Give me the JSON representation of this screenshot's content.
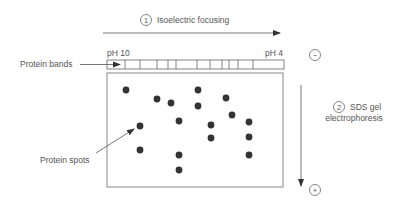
{
  "step1": {
    "number": "1",
    "label": "Isoelectric focusing"
  },
  "step2": {
    "number": "2",
    "label_line1": "SDS gel",
    "label_line2": "electrophoresis"
  },
  "ph_left": "pH 10",
  "ph_right": "pH 4",
  "labels": {
    "bands": "Protein bands",
    "spots": "Protein spots"
  },
  "electrodes": {
    "negative": "−",
    "positive": "+"
  },
  "band_lines_x": [
    125,
    140,
    157,
    168,
    176,
    197,
    210,
    222,
    229,
    238,
    253
  ],
  "spots": [
    [
      126,
      90
    ],
    [
      157,
      99
    ],
    [
      171,
      103
    ],
    [
      198,
      90
    ],
    [
      198,
      106
    ],
    [
      226,
      98
    ],
    [
      232,
      115
    ],
    [
      140,
      126
    ],
    [
      179,
      121
    ],
    [
      211,
      125
    ],
    [
      249,
      122
    ],
    [
      211,
      138
    ],
    [
      249,
      137
    ],
    [
      140,
      150
    ],
    [
      179,
      155
    ],
    [
      249,
      155
    ],
    [
      179,
      170
    ]
  ],
  "colors": {
    "line": "#666666",
    "spot": "#333333",
    "text": "#555555"
  }
}
